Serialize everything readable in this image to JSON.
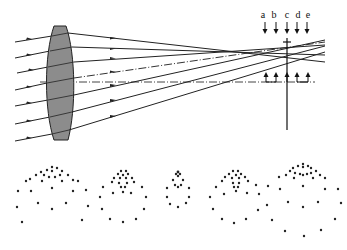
{
  "figure": {
    "plane_labels": [
      "a",
      "b",
      "c",
      "d",
      "e"
    ],
    "colors": {
      "lens_fill": "#8c8c8c",
      "line": "#222222",
      "background": "#ffffff"
    }
  },
  "spot_diagrams": [
    {
      "label": "a"
    },
    {
      "label": "b"
    },
    {
      "label": "c"
    },
    {
      "label": "d"
    },
    {
      "label": "e"
    }
  ]
}
